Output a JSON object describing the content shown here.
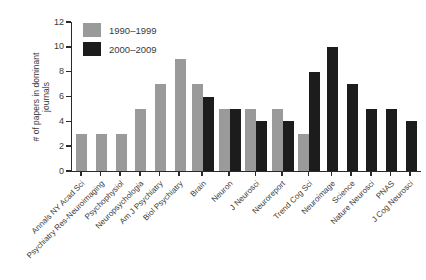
{
  "chart_data": {
    "type": "bar",
    "title": "",
    "xlabel": "",
    "ylabel": "# of papers in dominant\njournals",
    "ylim": [
      0,
      12
    ],
    "yticks": [
      0,
      2,
      4,
      6,
      8,
      10,
      12
    ],
    "grid": false,
    "legend_position": "top-left",
    "categories": [
      "Annals NY Acad Sci",
      "Psychiatry Res-Neuroimaging",
      "Psychophysiol",
      "Neuropsychologia",
      "Am J Psychiatry",
      "Biol Psychiatry",
      "Brain",
      "Neuron",
      "J Neurosci",
      "Neuroreport",
      "Trend Cog Sci",
      "Neuroimage",
      "Science",
      "Nature Neurosci",
      "PNAS",
      "J Cog Neurosci"
    ],
    "series": [
      {
        "name": "1990–1999",
        "color": "#9a9a9a",
        "values": [
          3,
          3,
          3,
          5,
          7,
          9,
          7,
          5,
          5,
          5,
          3,
          null,
          null,
          null,
          null,
          null
        ]
      },
      {
        "name": "2000–2009",
        "color": "#1c1c1c",
        "values": [
          null,
          null,
          null,
          null,
          null,
          null,
          6,
          5,
          4,
          4,
          8,
          10,
          7,
          5,
          5,
          4
        ]
      }
    ]
  }
}
